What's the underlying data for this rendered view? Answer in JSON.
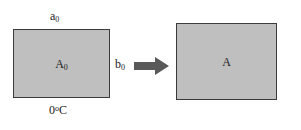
{
  "diagram": {
    "colors": {
      "plate_fill": "#bfbfbf",
      "plate_border": "#3a3a3a",
      "arrow": "#595959",
      "text": "#1a1a1a",
      "background": "#ffffff"
    },
    "initial_state": {
      "width_label": "a",
      "width_subscript": "0",
      "height_label": "b",
      "height_subscript": "0",
      "area_label": "A",
      "area_subscript": "0",
      "temperature_value": "0",
      "temperature_degree": "o",
      "temperature_unit": "C"
    },
    "final_state": {
      "width_label": "a",
      "height_label": "b",
      "area_label": "A",
      "temperature_value": "t",
      "temperature_degree": "o",
      "temperature_unit": "C"
    },
    "arrow": {
      "icon": "right-arrow-icon",
      "direction": "right"
    }
  }
}
